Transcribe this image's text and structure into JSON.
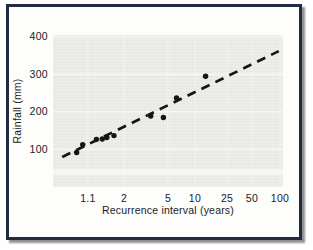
{
  "figure": {
    "frame_border_color": "#222c41",
    "shadow_color": "#8f8f8f",
    "page_background": "#ffffff"
  },
  "chart_data": {
    "type": "scatter",
    "title": "",
    "xlabel": "Recurrence interval (years)",
    "ylabel": "Rainfall (mm)",
    "x_scale": "gumbel-probability",
    "plot_bg": "#e8e8e4",
    "grid": true,
    "grid_color": "#fafaf8",
    "marker_color": "#151515",
    "ylim": [
      0,
      405
    ],
    "y_ticks": [
      {
        "label": "100",
        "value": 100
      },
      {
        "label": "200",
        "value": 200
      },
      {
        "label": "300",
        "value": 300
      },
      {
        "label": "400",
        "value": 400
      }
    ],
    "x_ticks": [
      {
        "label": "1.1",
        "value": 1.1,
        "pos": 0.152
      },
      {
        "label": "2",
        "value": 2,
        "pos": 0.309
      },
      {
        "label": "5",
        "value": 5,
        "pos": 0.5
      },
      {
        "label": "10",
        "value": 10,
        "pos": 0.617
      },
      {
        "label": "25",
        "value": 25,
        "pos": 0.757
      },
      {
        "label": "50",
        "value": 50,
        "pos": 0.865
      },
      {
        "label": "100",
        "value": 100,
        "pos": 0.987
      }
    ],
    "points": [
      {
        "t": 1.03,
        "mm": 92
      },
      {
        "t": 1.06,
        "mm": 113
      },
      {
        "t": 1.2,
        "mm": 127
      },
      {
        "t": 1.3,
        "mm": 128
      },
      {
        "t": 1.4,
        "mm": 132
      },
      {
        "t": 1.6,
        "mm": 137
      },
      {
        "t": 3.4,
        "mm": 189
      },
      {
        "t": 4.5,
        "mm": 185
      },
      {
        "t": 6.2,
        "mm": 237
      },
      {
        "t": 13.5,
        "mm": 295
      }
    ],
    "trend_line": {
      "style": "dashed",
      "color": "#151515",
      "from": {
        "t": 1.003,
        "mm": 80
      },
      "to": {
        "t": 97,
        "mm": 362
      }
    }
  }
}
